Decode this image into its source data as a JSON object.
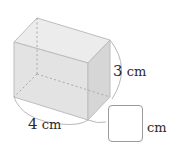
{
  "figure": {
    "shape": "rectangular cuboid",
    "colors": {
      "front_face": "#e3e3e3",
      "top_face": "#ececec",
      "side_face": "#d6d6d6",
      "edge": "#bdbdbd",
      "hidden_edge": "#a8a8a8",
      "arc": "#b8b8b8",
      "text": "#2b2b2b",
      "answer_box_border": "#9a9a9a"
    }
  },
  "labels": {
    "height": {
      "value": "3",
      "unit": "cm"
    },
    "width": {
      "value": "4",
      "unit": "cm"
    },
    "unknown": {
      "value": "",
      "unit": "cm"
    }
  }
}
